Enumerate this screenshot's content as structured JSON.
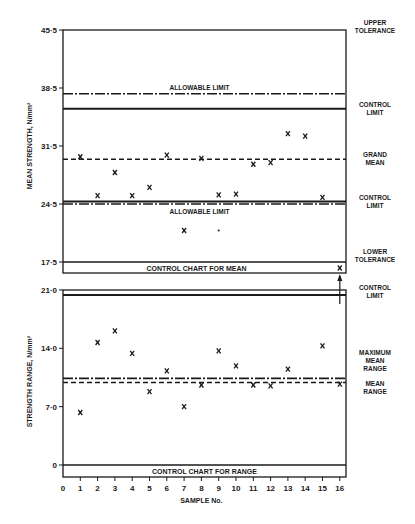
{
  "chart_data": [
    {
      "type": "scatter",
      "title": "CONTROL CHART FOR MEAN",
      "xlabel": "SAMPLE No.",
      "ylabel": "MEAN STRENGTH, N/mm²",
      "ylim": [
        17.5,
        45.5
      ],
      "y_ticks": [
        "17·5",
        "24·5",
        "31·5",
        "38·5",
        "45·5"
      ],
      "y_tick_values": [
        17.5,
        24.5,
        31.5,
        38.5,
        45.5
      ],
      "x": [
        1,
        2,
        3,
        4,
        5,
        6,
        7,
        8,
        9,
        10,
        11,
        12,
        13,
        14,
        15,
        16
      ],
      "values": [
        30.2,
        25.5,
        28.3,
        25.5,
        26.5,
        30.4,
        21.3,
        30.0,
        25.6,
        25.7,
        29.3,
        29.5,
        33.0,
        32.7,
        25.3,
        15.5
      ],
      "extra_points": [
        {
          "x": 9,
          "y": 21.3,
          "marker": "dot"
        }
      ],
      "off_chart_note": "Sample 16 mean plotted below lower tolerance with arrow",
      "reference_lines": [
        {
          "label": "UPPER TOLERANCE",
          "value": 45.5,
          "style": "solid"
        },
        {
          "label": "ALLOWABLE LIMIT",
          "value": 37.8,
          "style": "dash-dot"
        },
        {
          "label": "CONTROL LIMIT",
          "value": 36.0,
          "style": "solid"
        },
        {
          "label": "GRAND MEAN",
          "value": 29.9,
          "style": "dashed"
        },
        {
          "label": "CONTROL LIMIT",
          "value": 24.8,
          "style": "solid"
        },
        {
          "label": "ALLOWABLE LIMIT",
          "value": 24.5,
          "style": "dash-dot"
        },
        {
          "label": "LOWER TOLERANCE",
          "value": 17.5,
          "style": "solid"
        }
      ],
      "grid": false
    },
    {
      "type": "scatter",
      "title": "CONTROL CHART FOR RANGE",
      "xlabel": "SAMPLE No.",
      "ylabel": "STRENGTH RANGE, N/mm²",
      "ylim": [
        0,
        21.0
      ],
      "y_ticks": [
        "0",
        "7·0",
        "14·0",
        "21·0"
      ],
      "y_tick_values": [
        0,
        7.0,
        14.0,
        21.0
      ],
      "x": [
        1,
        2,
        3,
        4,
        5,
        6,
        7,
        8,
        9,
        10,
        11,
        12,
        13,
        15,
        16
      ],
      "values": [
        6.3,
        14.7,
        16.1,
        13.4,
        8.8,
        11.3,
        7.0,
        9.6,
        13.7,
        11.9,
        9.6,
        9.5,
        11.5,
        14.3,
        9.7
      ],
      "reference_lines": [
        {
          "label": "CONTROL LIMIT",
          "value": 20.4,
          "style": "solid"
        },
        {
          "label": "MAXIMUM MEAN RANGE",
          "value": 10.4,
          "style": "dash-dot"
        },
        {
          "label": "MEAN RANGE",
          "value": 9.9,
          "style": "dashed"
        }
      ],
      "x_ticks": [
        "0",
        "1",
        "2",
        "3",
        "4",
        "5",
        "6",
        "7",
        "8",
        "9",
        "10",
        "11",
        "12",
        "13",
        "14",
        "15",
        "16"
      ],
      "grid": false
    }
  ],
  "upper": {
    "ylabel": "MEAN STRENGTH, N/mm²",
    "title": "CONTROL CHART FOR MEAN",
    "line_labels": {
      "allowable_top": "ALLOWABLE LIMIT",
      "allowable_bottom": "ALLOWABLE LIMIT"
    },
    "right_labels": [
      [
        "UPPER",
        "TOLERANCE"
      ],
      [
        "CONTROL",
        "LIMIT"
      ],
      [
        "GRAND",
        "MEAN"
      ],
      [
        "CONTROL",
        "LIMIT"
      ],
      [
        "LOWER",
        "TOLERANCE"
      ]
    ]
  },
  "lower": {
    "ylabel": "STRENGTH RANGE, N/mm²",
    "title": "CONTROL CHART FOR RANGE",
    "right_labels": [
      [
        "CONTROL",
        "LIMIT"
      ],
      [
        "MAXIMUM",
        "MEAN",
        "RANGE"
      ],
      [
        "MEAN",
        "RANGE"
      ]
    ]
  },
  "xaxis": {
    "label": "SAMPLE No."
  },
  "marker": "x"
}
